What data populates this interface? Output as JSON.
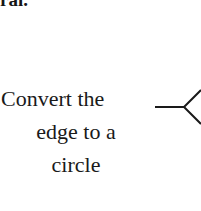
{
  "page": {
    "background_color": "#ffffff",
    "width": 201,
    "height": 211
  },
  "heading": {
    "text_fragment": "ral.",
    "style": "bold-serif",
    "clipped": "top",
    "color": "#151515"
  },
  "caption": {
    "full_text": "Convert the edge to a circle",
    "lines": [
      "Convert the",
      "edge to a",
      "circle"
    ],
    "alignment": "center",
    "color": "#1a1a1a"
  },
  "connector": {
    "type": "line-with-branching-arrow",
    "description": "horizontal leader line terminating in a less-than shaped fork at the right edge",
    "stroke_color": "#1a1a1a",
    "stroke_width": 2,
    "line_start_x": 5,
    "line_end_x": 34,
    "line_y": 23,
    "vertex_x": 34,
    "vertex_y": 23,
    "upper_branch_end_x": 51,
    "upper_branch_end_y": 6,
    "lower_branch_end_x": 51,
    "lower_branch_end_y": 40
  }
}
